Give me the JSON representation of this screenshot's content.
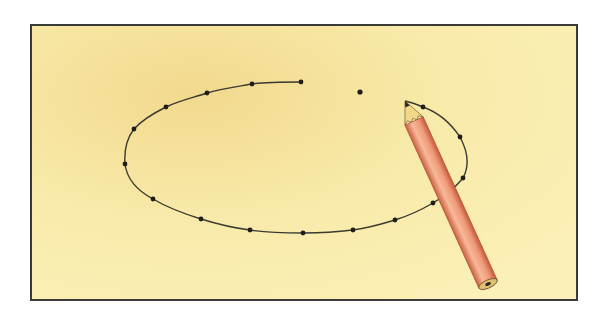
{
  "illustration": {
    "description": "Dotted ellipse being traced with a pencil on yellow paper",
    "colors": {
      "background": "#ffffff",
      "paper": "#f8eaa9",
      "paper_shade": "#f2d98e",
      "frame": "#3a3a38",
      "curve": "#3b3a30",
      "dot": "#1e1d18",
      "pencil_body": "#ef9a78",
      "pencil_edge": "#b8563a",
      "pencil_highlight": "#f8b89a",
      "pencil_wood": "#f3d88a",
      "pencil_lead": "#2a2620"
    },
    "frame": {
      "x": 31,
      "y": 25,
      "width": 546,
      "height": 275
    },
    "curve_dots": [
      [
        301,
        82
      ],
      [
        252,
        84
      ],
      [
        207,
        93
      ],
      [
        166,
        107
      ],
      [
        134,
        129
      ],
      [
        125,
        164
      ],
      [
        153,
        199
      ],
      [
        201,
        219
      ],
      [
        250,
        230
      ],
      [
        303,
        233
      ],
      [
        353,
        230
      ],
      [
        395,
        220
      ],
      [
        433,
        203
      ],
      [
        463,
        178
      ],
      [
        460,
        137
      ],
      [
        423,
        107
      ]
    ],
    "isolated_dot": [
      360,
      92
    ],
    "pencil": {
      "tip": [
        405,
        101
      ],
      "end": [
        488,
        284
      ],
      "width": 20
    }
  }
}
